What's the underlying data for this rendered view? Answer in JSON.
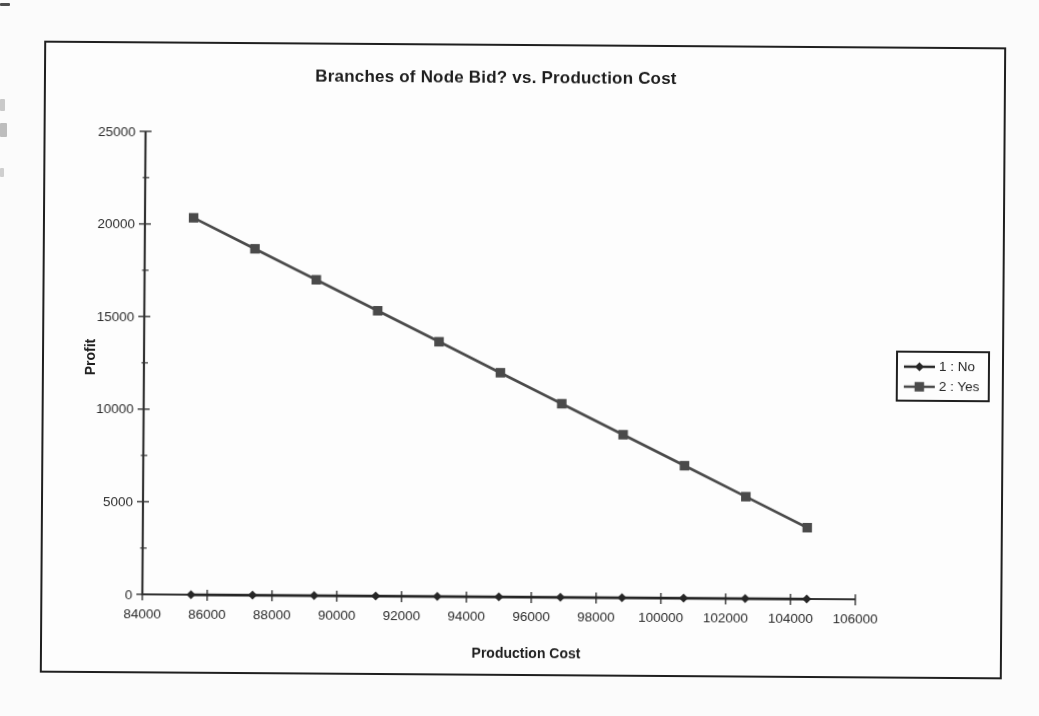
{
  "chart_data": {
    "type": "line",
    "title": "Branches of Node Bid? vs. Production Cost",
    "xlabel": "Production Cost",
    "ylabel": "Profit",
    "xlim": [
      84000,
      106000
    ],
    "ylim": [
      0,
      25000
    ],
    "x_tick_step": 2000,
    "y_tick_step": 5000,
    "y_minor_tick_step": 2500,
    "grid": false,
    "legend_position": "right",
    "x": [
      85500,
      87400,
      89300,
      91200,
      93100,
      95000,
      96900,
      98800,
      100700,
      102600,
      104500
    ],
    "series": [
      {
        "name": "1 : No",
        "marker": "diamond",
        "color": "#262626",
        "values": [
          0,
          0,
          0,
          0,
          0,
          0,
          0,
          0,
          0,
          0,
          0
        ]
      },
      {
        "name": "2 : Yes",
        "marker": "square",
        "color": "#4a4a4a",
        "values": [
          20350,
          18700,
          17050,
          15400,
          13750,
          12100,
          10450,
          8800,
          7150,
          5500,
          3850
        ]
      }
    ],
    "x_tick_labels": [
      "84000",
      "86000",
      "88000",
      "90000",
      "92000",
      "94000",
      "96000",
      "98000",
      "100000",
      "102000",
      "104000",
      "106000"
    ],
    "y_tick_labels": [
      "0",
      "5000",
      "10000",
      "15000",
      "20000",
      "25000"
    ],
    "colors": {
      "axis": "#333333",
      "tick_text": "#2d2d2d",
      "frame_border": "#1f1f1f",
      "plot_background": "#fdfdfd"
    }
  }
}
